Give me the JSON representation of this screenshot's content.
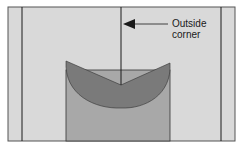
{
  "diagram": {
    "label_line1": "Outside",
    "label_line2": "corner",
    "colors": {
      "background": "#d9d9d9",
      "lens": "#7a7a7a",
      "column": "#a8a8a8",
      "line": "#1a1a1a",
      "frame": "#555555"
    }
  }
}
